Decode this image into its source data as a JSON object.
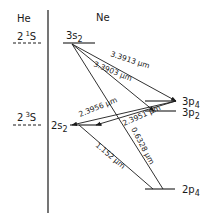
{
  "columns": {
    "left": "He",
    "right": "Ne"
  },
  "he_levels": [
    {
      "id": "he-2-1S",
      "label_main": "2",
      "label_sup": "1",
      "label_term": "S"
    },
    {
      "id": "he-2-3S",
      "label_main": "2",
      "label_sup": "3",
      "label_term": "S"
    }
  ],
  "ne_levels": [
    {
      "id": "3s2",
      "label_main": "3s",
      "label_sub": "2"
    },
    {
      "id": "3p4",
      "label_main": "3p",
      "label_sub": "4"
    },
    {
      "id": "3p2",
      "label_main": "3p",
      "label_sub": "2"
    },
    {
      "id": "2s2",
      "label_main": "2s",
      "label_sub": "2"
    },
    {
      "id": "2p4",
      "label_main": "2p",
      "label_sub": "4"
    }
  ],
  "transitions": [
    {
      "from": "3s2",
      "to": "3p4",
      "label": "3.3913 μm"
    },
    {
      "from": "3s2",
      "to": "3p2",
      "label": "3.3903 μm"
    },
    {
      "from": "3p4",
      "to": "2s2",
      "label": "2.3956 μm"
    },
    {
      "from": "3p2",
      "to": "2s2",
      "label": "2.3951 μm"
    },
    {
      "from": "3s2",
      "to": "2p4",
      "label": "0.6328 μm"
    },
    {
      "from": "2s2",
      "to": "2p4",
      "label": "1.152 μm"
    }
  ],
  "colors": {
    "ink": "#1a1a1a",
    "background": "#ffffff"
  }
}
